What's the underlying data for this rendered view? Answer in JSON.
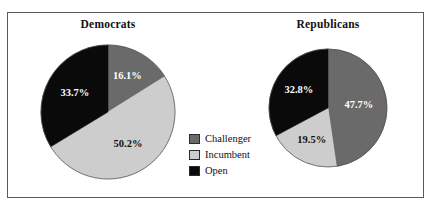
{
  "figure": {
    "background": "#ffffff",
    "frame_color": "#5a5a5a",
    "top_remnant": ""
  },
  "palette": {
    "challenger": "#6a6a6a",
    "incumbent": "#cdcdcd",
    "open": "#0a0a0a",
    "label_on_dark": "#ffffff",
    "label_on_light": "#111111"
  },
  "legend": {
    "position": "center-between-pies",
    "items": [
      {
        "label": "Challenger",
        "color": "#6a6a6a"
      },
      {
        "label": "Incumbent",
        "color": "#cdcdcd"
      },
      {
        "label": "Open",
        "color": "#0a0a0a"
      }
    ]
  },
  "panels": {
    "democrats": {
      "title": "Democrats",
      "labels": {
        "challenger": "16.1%",
        "incumbent": "50.2%",
        "open": "33.7%"
      }
    },
    "republicans": {
      "title": "Republicans",
      "labels": {
        "challenger": "47.7%",
        "incumbent": "19.5%",
        "open": "32.8%"
      }
    }
  },
  "chart_data": [
    {
      "type": "pie",
      "title": "Democrats",
      "categories": [
        "Challenger",
        "Incumbent",
        "Open"
      ],
      "values": [
        16.1,
        50.2,
        33.7
      ],
      "value_labels": [
        "16.1%",
        "50.2%",
        "33.7%"
      ],
      "colors": [
        "#6a6a6a",
        "#cdcdcd",
        "#0a0a0a"
      ],
      "units": "percent",
      "start_angle_deg": 0,
      "direction": "clockwise",
      "legend": "shared, center",
      "xlabel": "",
      "ylabel": ""
    },
    {
      "type": "pie",
      "title": "Republicans",
      "categories": [
        "Challenger",
        "Incumbent",
        "Open"
      ],
      "values": [
        47.7,
        19.5,
        32.8
      ],
      "value_labels": [
        "47.7%",
        "19.5%",
        "32.8%"
      ],
      "colors": [
        "#6a6a6a",
        "#cdcdcd",
        "#0a0a0a"
      ],
      "units": "percent",
      "start_angle_deg": 0,
      "direction": "clockwise",
      "legend": "shared, center",
      "xlabel": "",
      "ylabel": ""
    }
  ]
}
